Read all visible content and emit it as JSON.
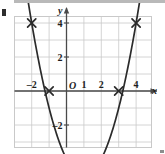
{
  "figure": {
    "kind": "coordinate-grid-graph"
  },
  "chart_data": {
    "type": "line",
    "title": "",
    "subtitle": "",
    "xlabel": "x",
    "ylabel": "y",
    "origin_label": "O",
    "xlim": [
      -3,
      4.6
    ],
    "ylim": [
      -7.2,
      7.2
    ],
    "grid": true,
    "grid_step_x": 1,
    "grid_step_y": 1,
    "legend": "none",
    "x_tick_labels": [
      "–2",
      "1",
      "2",
      "4"
    ],
    "x_tick_values": [
      -2,
      1,
      2,
      4
    ],
    "y_tick_labels": [
      "6",
      "4",
      "2",
      "–2",
      "–4",
      "–6"
    ],
    "y_tick_values": [
      6,
      4,
      2,
      -2,
      -4,
      -6
    ],
    "series": [
      {
        "name": "parabola",
        "marker": "x-cross",
        "curve": "smooth",
        "color": "#2b2b2b",
        "equation": "y = x^2 - 2x - 4",
        "points": [
          {
            "x": -2,
            "y": 4
          },
          {
            "x": -1,
            "y": 0
          },
          {
            "x": 0,
            "y": -4
          },
          {
            "x": 1,
            "y": -5
          },
          {
            "x": 2,
            "y": -4
          },
          {
            "x": 3,
            "y": 0
          },
          {
            "x": 4,
            "y": 4
          }
        ]
      }
    ]
  },
  "colors": {
    "curve": "#2b2b2b",
    "axis": "#4a4a4a",
    "grid": "#c9c9c9",
    "label": "#1d1d1d",
    "top_bar": "#b9b9b9"
  }
}
